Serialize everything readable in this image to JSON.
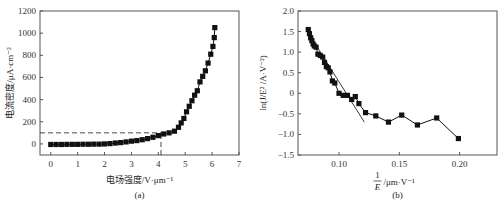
{
  "chart_data": [
    {
      "id": "a",
      "type": "line",
      "caption": "(a)",
      "title": "",
      "xlabel": "电场强度/V·μm⁻¹",
      "ylabel": "电流密度/μA·cm⁻²",
      "xlim": [
        -0.4,
        7
      ],
      "ylim": [
        -100,
        1200
      ],
      "xticks": [
        0,
        1,
        2,
        3,
        4,
        5,
        6,
        7
      ],
      "yticks": [
        0,
        200,
        400,
        600,
        800,
        1000,
        1200
      ],
      "grid": false,
      "legend": null,
      "marker": "square",
      "annotations": [
        {
          "type": "dashed-hline",
          "y": 100,
          "x_from": -0.4,
          "x_to": 4.1
        },
        {
          "type": "dashed-vline",
          "x": 4.1,
          "y_from": -100,
          "y_to": 100
        }
      ],
      "series": [
        {
          "name": "J-E",
          "x": [
            0.0,
            0.2,
            0.4,
            0.6,
            0.8,
            1.0,
            1.2,
            1.4,
            1.6,
            1.8,
            2.0,
            2.2,
            2.4,
            2.6,
            2.8,
            3.0,
            3.2,
            3.4,
            3.6,
            3.8,
            4.0,
            4.2,
            4.4,
            4.6,
            4.75,
            4.85,
            4.95,
            5.05,
            5.15,
            5.25,
            5.35,
            5.45,
            5.55,
            5.65,
            5.75,
            5.85,
            5.95,
            6.03,
            6.08,
            6.1
          ],
          "values": [
            -5,
            -5,
            -5,
            -4,
            -4,
            -4,
            -3,
            -3,
            -2,
            -2,
            0,
            3,
            8,
            12,
            18,
            25,
            30,
            38,
            48,
            60,
            75,
            90,
            100,
            115,
            150,
            190,
            230,
            290,
            340,
            390,
            440,
            480,
            560,
            610,
            660,
            730,
            810,
            880,
            960,
            1050
          ]
        }
      ]
    },
    {
      "id": "b",
      "type": "line",
      "caption": "(b)",
      "title": "",
      "xlabel": "1/E /μm·V⁻¹",
      "ylabel": "ln(J/E² /A·V⁻²)",
      "xlim": [
        0.066,
        0.231
      ],
      "ylim": [
        -1.5,
        2.0
      ],
      "xticks": [
        0.1,
        0.15,
        0.2
      ],
      "yticks": [
        -1.5,
        -1.0,
        -0.5,
        0,
        0.5,
        1.0,
        1.5,
        2.0
      ],
      "grid": false,
      "legend": null,
      "marker": "square",
      "annotations": [
        {
          "type": "fit-line",
          "x1": 0.077,
          "y1": 1.35,
          "x2": 0.121,
          "y2": -0.7
        }
      ],
      "series": [
        {
          "name": "F-N",
          "x": [
            0.0745,
            0.0755,
            0.0765,
            0.0775,
            0.0785,
            0.0795,
            0.081,
            0.0825,
            0.0845,
            0.0865,
            0.088,
            0.0895,
            0.091,
            0.0925,
            0.0945,
            0.0965,
            0.1,
            0.1035,
            0.107,
            0.1105,
            0.1135,
            0.1165,
            0.122,
            0.1305,
            0.141,
            0.152,
            0.165,
            0.181,
            0.199
          ],
          "values": [
            1.55,
            1.45,
            1.35,
            1.28,
            1.2,
            1.15,
            1.12,
            0.95,
            0.92,
            0.88,
            0.75,
            0.65,
            0.62,
            0.52,
            0.3,
            0.25,
            0.0,
            -0.05,
            -0.05,
            -0.15,
            -0.08,
            -0.25,
            -0.47,
            -0.55,
            -0.7,
            -0.53,
            -0.77,
            -0.6,
            -1.1
          ]
        }
      ]
    }
  ]
}
